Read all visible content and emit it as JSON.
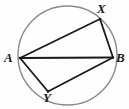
{
  "diagram": {
    "background_color": "#fefefe",
    "circle": {
      "name": "circumscribed-circle",
      "cx": 67.5,
      "cy": 55.5,
      "r": 49.5,
      "stroke_color": "#8a8a8a",
      "stroke_width": 1.4,
      "fill": "none"
    },
    "points": [
      {
        "id": "A",
        "label": "A",
        "x": 20.0,
        "y": 58.0,
        "label_x": 4,
        "label_y": 51
      },
      {
        "id": "X",
        "label": "X",
        "x": 100.0,
        "y": 19.0,
        "label_x": 97,
        "label_y": 2
      },
      {
        "id": "B",
        "label": "B",
        "x": 113.0,
        "y": 57.5,
        "label_x": 116,
        "label_y": 51
      },
      {
        "id": "Y",
        "label": "Y",
        "x": 48.0,
        "y": 91.5,
        "label_x": 43,
        "label_y": 91
      }
    ],
    "segments": [
      {
        "id": "AX",
        "from": "A",
        "to": "X",
        "x1": 20.0,
        "y1": 58.0,
        "x2": 100.0,
        "y2": 19.0
      },
      {
        "id": "AB",
        "from": "A",
        "to": "B",
        "x1": 20.0,
        "y1": 58.0,
        "x2": 113.0,
        "y2": 57.5
      },
      {
        "id": "AY",
        "from": "A",
        "to": "Y",
        "x1": 20.0,
        "y1": 58.0,
        "x2": 48.0,
        "y2": 91.5
      },
      {
        "id": "XB",
        "from": "X",
        "to": "B",
        "x1": 100.0,
        "y1": 19.0,
        "x2": 113.0,
        "y2": 57.5
      },
      {
        "id": "YB",
        "from": "Y",
        "to": "B",
        "x1": 48.0,
        "y1": 91.5,
        "x2": 113.0,
        "y2": 57.5
      }
    ],
    "segment_stroke_color": "#1a1a1a",
    "segment_stroke_width": 1.8
  }
}
